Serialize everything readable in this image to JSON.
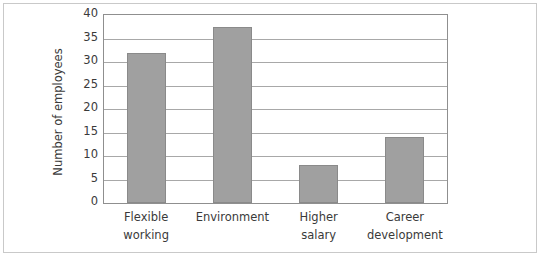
{
  "chart_data": {
    "type": "bar",
    "title": "",
    "xlabel": "",
    "ylabel": "Number of employees",
    "categories": [
      "Flexible working",
      "Environment",
      "Higher salary",
      "Career development"
    ],
    "category_lines": [
      [
        "Flexible",
        "working"
      ],
      [
        "Environment",
        ""
      ],
      [
        "Higher",
        "salary"
      ],
      [
        "Career",
        "development"
      ]
    ],
    "values": [
      32,
      37.5,
      8,
      14
    ],
    "ylim": [
      0,
      40
    ],
    "yticks": [
      0,
      5,
      10,
      15,
      20,
      25,
      30,
      35,
      40
    ],
    "ytick_labels": [
      "0",
      "5",
      "10",
      "15",
      "20",
      "25",
      "30",
      "35",
      "40"
    ],
    "grid": true,
    "legend": false,
    "bar_color": "#a0a0a0",
    "bar_edge_color": "#8a8a8a",
    "gridline_color": "#a8a8a8",
    "axis_color": "#8f8f8f",
    "frame_color": "#c9c9c9",
    "background": "#ffffff",
    "text_color": "#3a3a3a"
  }
}
